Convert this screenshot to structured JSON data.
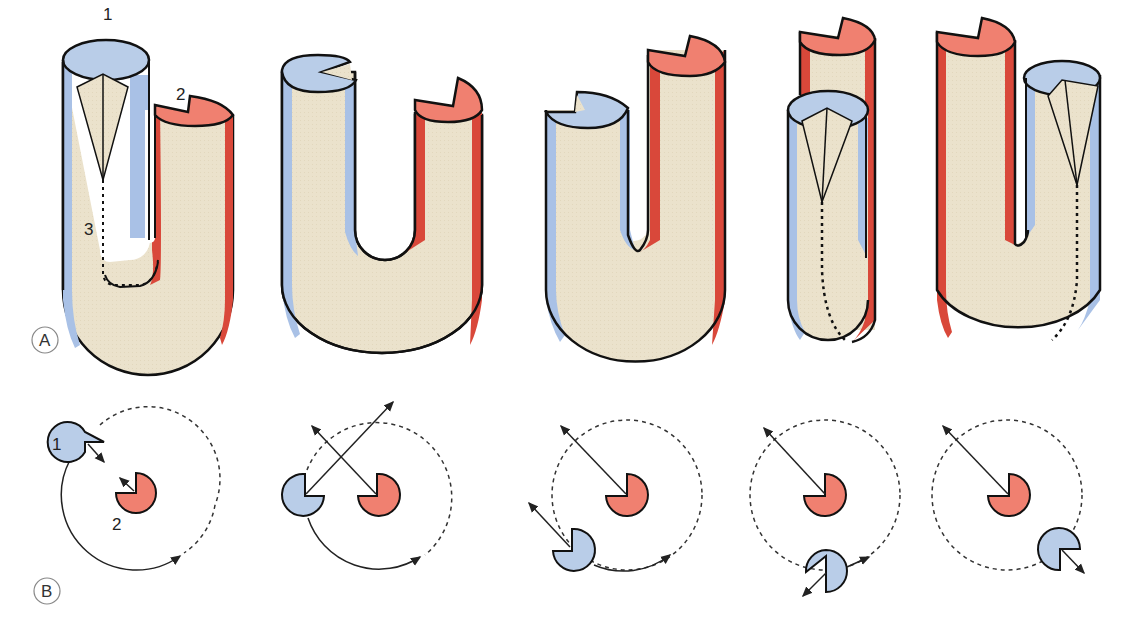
{
  "figure": {
    "panels": [
      {
        "id": "A",
        "label": "A",
        "description": "Five stages of U-shaped tube with blue (1) and red (2) limbs"
      },
      {
        "id": "B",
        "label": "B",
        "description": "Top-view rotation diagrams showing limb 1 orbiting limb 2"
      }
    ],
    "labels": {
      "limb1": "1",
      "limb2": "2",
      "seam": "3",
      "limb1_b": "1",
      "limb2_b": "2"
    },
    "colors": {
      "tube_body": "#ebe2cc",
      "blue_limb": "#b9cde8",
      "blue_edge": "#9db8e0",
      "red_limb": "#f08070",
      "red_edge": "#d9483a",
      "outline": "#111111",
      "circle_label": "#888888"
    },
    "stages": [
      "stage-1",
      "stage-2",
      "stage-3",
      "stage-4",
      "stage-5"
    ]
  }
}
